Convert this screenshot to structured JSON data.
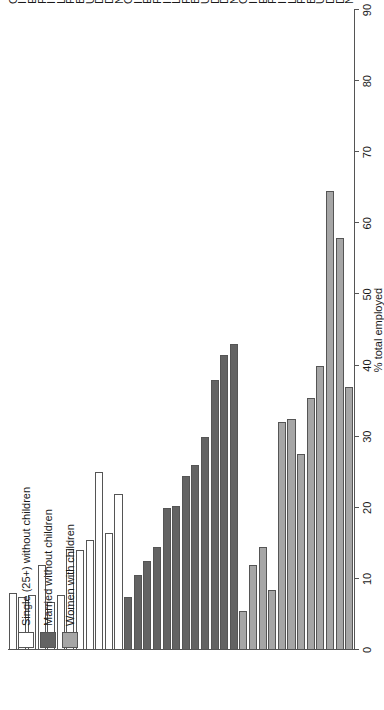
{
  "chart_data": {
    "type": "bar",
    "orientation": "horizontal",
    "title": "",
    "xlabel": "% total employed",
    "ylabel": "",
    "xlim": [
      0,
      90
    ],
    "xticks": [
      0,
      10,
      20,
      30,
      40,
      50,
      60,
      70,
      80,
      90
    ],
    "grid": false,
    "legend_position": "top-left",
    "categories": [
      "GR",
      "I",
      "E",
      "P",
      "IRL",
      "L",
      "F",
      "BE12",
      "UK",
      "D",
      "DK",
      "NL"
    ],
    "series": [
      {
        "name": "Single (25+) without children",
        "color": "#ffffff",
        "values": [
          8.0,
          7.5,
          7.8,
          12.0,
          6.8,
          7.8,
          14.2,
          14.0,
          15.5,
          25.0,
          16.5,
          22.0
        ]
      },
      {
        "name": "Married without children",
        "color": "#636363",
        "values": [
          7.5,
          10.5,
          12.5,
          14.5,
          20.0,
          20.2,
          24.5,
          26.0,
          30.0,
          38.0,
          41.5,
          43.0
        ]
      },
      {
        "name": "Women with children",
        "color": "#a6a6a6",
        "values": [
          5.5,
          12.0,
          14.5,
          8.5,
          32.0,
          32.5,
          27.5,
          35.5,
          40.0,
          64.5,
          58.0,
          37.0
        ]
      }
    ],
    "extra_bars": [
      {
        "series": "Single (25+) without children",
        "category": "NL",
        "value": 36.5
      },
      {
        "series": "Married without children",
        "category": "NL",
        "value": 65.0
      },
      {
        "series": "Women with children",
        "category": "NL",
        "value": 86.5
      }
    ]
  },
  "axis": {
    "value_axis_title": "% total employed",
    "tick_labels": [
      "0",
      "10",
      "20",
      "30",
      "40",
      "50",
      "60",
      "70",
      "80",
      "90"
    ]
  },
  "legend": {
    "items": [
      {
        "label": "Single (25+) without children",
        "color": "#ffffff"
      },
      {
        "label": "Married without children",
        "color": "#636363"
      },
      {
        "label": "Women with children",
        "color": "#a6a6a6"
      }
    ]
  },
  "category_labels": [
    "GR",
    "I",
    "E",
    "P",
    "IRL",
    "L",
    "F",
    "BE12",
    "UK",
    "D",
    "DK",
    "NL"
  ]
}
